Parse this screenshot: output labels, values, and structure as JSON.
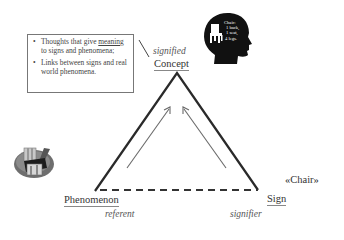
{
  "diagram": {
    "note_box": {
      "items": [
        {
          "pre": "Thoughts that give ",
          "emph": "meaning",
          "post": " to signs and phenomena;"
        },
        {
          "pre": "Links between signs and real world phenomena.",
          "emph": "",
          "post": ""
        }
      ],
      "bullet": "•"
    },
    "vertices": {
      "concept": {
        "term": "Concept",
        "role": "signified"
      },
      "phenomenon": {
        "term": "Phenomenon",
        "role": "referent"
      },
      "sign": {
        "term": "Sign",
        "role": "signifier"
      }
    },
    "sign_example": "«Chair»",
    "head_icon_text": [
      "Chair:",
      "1 back,",
      "1 seat,",
      "4 legs."
    ],
    "edges": [
      {
        "from": "phenomenon",
        "to": "concept",
        "style": "solid"
      },
      {
        "from": "sign",
        "to": "concept",
        "style": "solid"
      },
      {
        "from": "phenomenon",
        "to": "sign",
        "style": "dashed"
      }
    ],
    "colors": {
      "line": "#2a2a2a",
      "arrow": "#6a6a6a",
      "box_border": "#777777",
      "head": "#111111",
      "text_italic": "#555555"
    }
  }
}
